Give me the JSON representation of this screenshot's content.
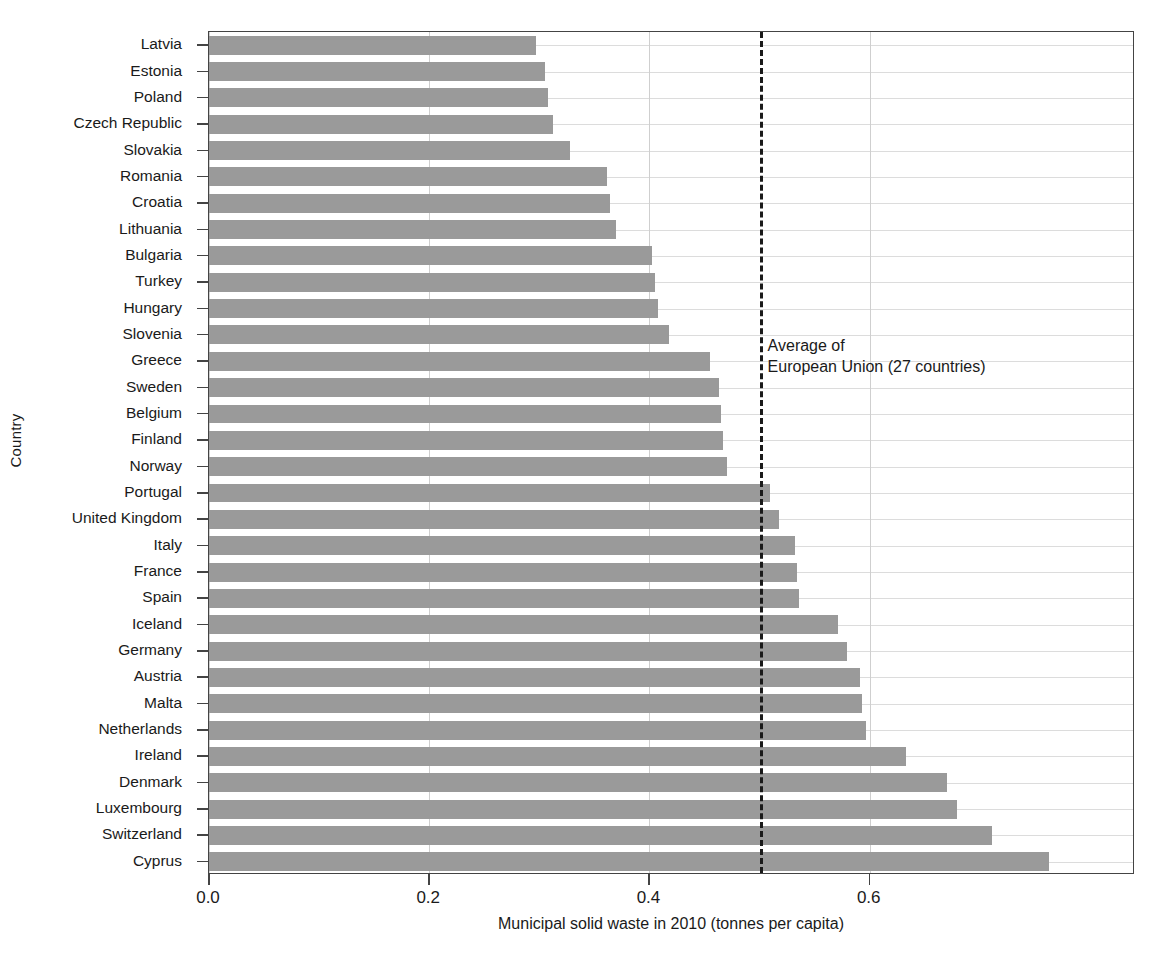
{
  "chart_data": {
    "type": "bar",
    "orientation": "horizontal",
    "title": "",
    "xlabel": "Municipal solid waste in 2010 (tonnes per capita)",
    "ylabel": "Country",
    "xlim": [
      0.0,
      0.8409
    ],
    "xticks": [
      "0.0",
      "0.2",
      "0.4",
      "0.6"
    ],
    "xtick_values": [
      0.0,
      0.2,
      0.4,
      0.6
    ],
    "grid": "both",
    "legend": "none",
    "bar_color": "#9a9a9a",
    "categories": [
      "Latvia",
      "Estonia",
      "Poland",
      "Czech Republic",
      "Slovakia",
      "Romania",
      "Croatia",
      "Lithuania",
      "Bulgaria",
      "Turkey",
      "Hungary",
      "Slovenia",
      "Greece",
      "Sweden",
      "Belgium",
      "Finland",
      "Norway",
      "Portugal",
      "United Kingdom",
      "Italy",
      "France",
      "Spain",
      "Iceland",
      "Germany",
      "Austria",
      "Malta",
      "Netherlands",
      "Ireland",
      "Denmark",
      "Luxembourg",
      "Switzerland",
      "Cyprus"
    ],
    "values": [
      0.297,
      0.305,
      0.308,
      0.312,
      0.328,
      0.361,
      0.364,
      0.37,
      0.402,
      0.405,
      0.408,
      0.418,
      0.455,
      0.463,
      0.465,
      0.467,
      0.47,
      0.509,
      0.518,
      0.532,
      0.534,
      0.536,
      0.571,
      0.579,
      0.591,
      0.593,
      0.597,
      0.633,
      0.67,
      0.679,
      0.711,
      0.763
    ],
    "annotations": [
      {
        "name": "eu-average-line",
        "type": "vline",
        "value": 0.5,
        "style": "dashed",
        "color": "#1a1a1a",
        "label_line1": "Average of",
        "label_line2": "European Union (27 countries)"
      }
    ]
  }
}
